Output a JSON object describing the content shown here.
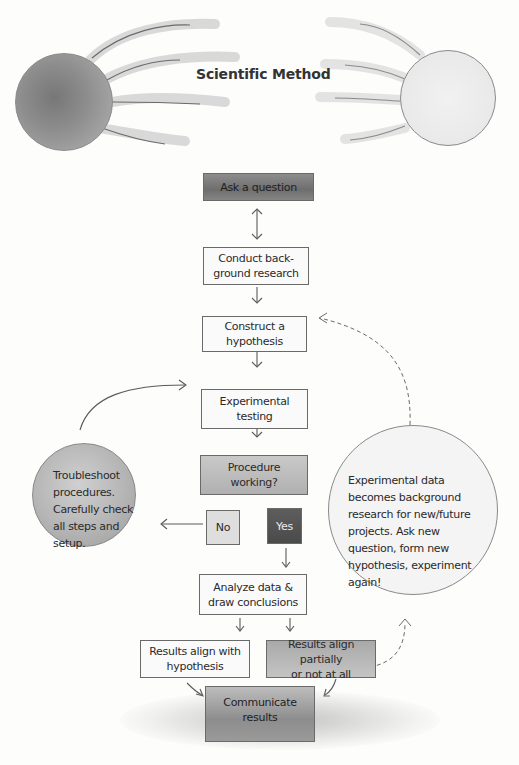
{
  "title": "Scientific Method",
  "steps": {
    "ask": "Ask a question",
    "research_l1": "Conduct back-",
    "research_l2": "ground research",
    "hypothesis_l1": "Construct a",
    "hypothesis_l2": "hypothesis",
    "testing_l1": "Experimental",
    "testing_l2": "testing",
    "procedure_l1": "Procedure",
    "procedure_l2": "working?",
    "no": "No",
    "yes": "Yes",
    "analyze_l1": "Analyze data &",
    "analyze_l2": "draw conclusions",
    "align_l1": "Results align with",
    "align_l2": "hypothesis",
    "partial_l1": "Results align partially",
    "partial_l2": "or not at all",
    "communicate": "Communicate results"
  },
  "troubleshoot": {
    "lines": [
      "Troubleshoot",
      "procedures.",
      "Carefully check",
      "all steps and",
      "setup."
    ]
  },
  "feedback": {
    "lines": [
      "Experimental data",
      "becomes background",
      "research for new/future",
      "projects.  Ask new",
      "question, form new",
      "hypothesis, experiment",
      "again!"
    ]
  },
  "colors": {
    "line": "#5a5a5a",
    "dark_box": "#757575",
    "yes_box": "#505050",
    "paper": "#fdfdfc"
  }
}
